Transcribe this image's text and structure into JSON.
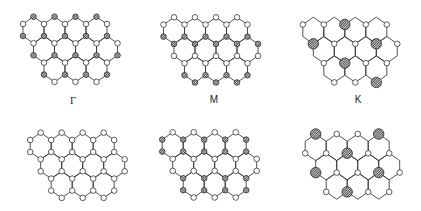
{
  "figure": {
    "width": 421,
    "height": 211,
    "colors": {
      "background": "#ffffff",
      "bond": "#333333",
      "open_atom_fill": "#ffffff",
      "atom_outline": "#333333",
      "hatch_line": "#333333",
      "hatch_background": "#cfcfcf"
    }
  },
  "lattice": {
    "type": "honeycomb",
    "half_width": 10.5,
    "level_offsets": [
      0,
      7.3,
      19.3,
      26.6,
      38.6,
      45.9,
      57.9,
      65.2
    ],
    "rows": [
      {
        "level_top": 0,
        "centers_k": [
          0,
          2,
          4,
          6
        ]
      },
      {
        "level_top": 2,
        "centers_k": [
          1,
          3,
          5,
          7
        ]
      },
      {
        "level_top": 4,
        "centers_k": [
          2,
          4,
          6
        ]
      }
    ],
    "small_radius": 2.8,
    "large_radius": 5.2
  },
  "panels": [
    {
      "id": "gamma",
      "label": "Γ",
      "origin": [
        33.5,
        16.7
      ],
      "mode": "levels",
      "levels": [
        "H",
        "W",
        "H",
        "W",
        "H",
        "W",
        "H",
        "W"
      ]
    },
    {
      "id": "m",
      "label": "M",
      "origin": [
        174,
        17.3
      ],
      "mode": "levels",
      "levels": [
        "W",
        "W",
        "H",
        "H",
        "W",
        "W",
        "H",
        "H"
      ]
    },
    {
      "id": "k",
      "label": "K",
      "origin": [
        313.3,
        17.2
      ],
      "mode": "sublattice",
      "sublattice": "B",
      "hatched": [
        [
          1,
          3
        ],
        [
          3,
          0
        ],
        [
          3,
          6
        ],
        [
          5,
          3
        ],
        [
          7,
          6
        ]
      ]
    },
    {
      "id": "bottom-left",
      "origin": [
        40.7,
        132.7
      ],
      "mode": "levels",
      "levels": [
        "W",
        "W",
        "W",
        "W",
        "W",
        "W",
        "W",
        "W"
      ]
    },
    {
      "id": "bottom-middle",
      "origin": [
        172.7,
        132.3
      ],
      "mode": "levels",
      "levels": [
        "W",
        "H",
        "H",
        "W",
        "W",
        "H",
        "H",
        "W"
      ]
    },
    {
      "id": "bottom-right",
      "origin": [
        315.7,
        134
      ],
      "mode": "sublattice",
      "sublattice": "A",
      "hatched": [
        [
          0,
          0
        ],
        [
          0,
          6
        ],
        [
          2,
          3
        ],
        [
          4,
          0
        ],
        [
          4,
          6
        ],
        [
          6,
          3
        ]
      ]
    }
  ]
}
